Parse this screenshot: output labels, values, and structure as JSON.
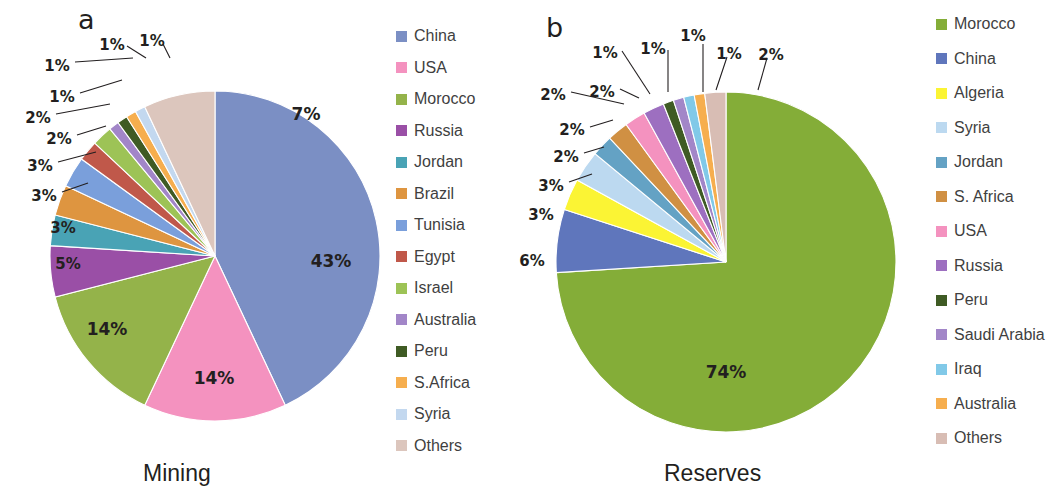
{
  "figure": {
    "panels": [
      {
        "letter": "a",
        "caption": "Mining",
        "legend_title": ""
      },
      {
        "letter": "b",
        "caption": "Reserves",
        "legend_title": ""
      }
    ]
  },
  "chart_data": [
    {
      "type": "pie",
      "title": "Mining",
      "panel_letter": "a",
      "labels": [
        "China",
        "USA",
        "Morocco",
        "Russia",
        "Jordan",
        "Brazil",
        "Tunisia",
        "Egypt",
        "Israel",
        "Australia",
        "Peru",
        "S.Africa",
        "Syria",
        "Others"
      ],
      "values": [
        43,
        14,
        14,
        5,
        3,
        3,
        3,
        2,
        2,
        1,
        1,
        1,
        1,
        7
      ],
      "value_labels": [
        "43%",
        "14%",
        "14%",
        "5%",
        "3%",
        "3%",
        "3%",
        "2%",
        "2%",
        "1%",
        "1%",
        "1%",
        "1%",
        "7%"
      ],
      "colors": [
        "#7b8fc4",
        "#f492bf",
        "#94b34a",
        "#9a4fa6",
        "#49a3b5",
        "#de9540",
        "#7a9fdb",
        "#c0584a",
        "#9dc356",
        "#a286c8",
        "#3f5b24",
        "#f6ae4e",
        "#c3d8ef",
        "#dcc6bd"
      ],
      "legend_position": "right",
      "units": "percent"
    },
    {
      "type": "pie",
      "title": "Reserves",
      "panel_letter": "b",
      "labels": [
        "Morocco",
        "China",
        "Algeria",
        "Syria",
        "Jordan",
        "S. Africa",
        "USA",
        "Russia",
        "Peru",
        "Saudi Arabia",
        "Iraq",
        "Australia",
        "Others"
      ],
      "values": [
        74,
        6,
        3,
        3,
        2,
        2,
        2,
        2,
        1,
        1,
        1,
        1,
        2
      ],
      "value_labels": [
        "74%",
        "6%",
        "3%",
        "3%",
        "2%",
        "2%",
        "2%",
        "2%",
        "1%",
        "1%",
        "1%",
        "1%",
        "2%"
      ],
      "colors": [
        "#84ad38",
        "#5f76bc",
        "#fbf434",
        "#bcd9f0",
        "#64a2c4",
        "#d09043",
        "#f492bf",
        "#9d6fc0",
        "#3f5b24",
        "#a286c8",
        "#81c9e8",
        "#f6ae4e",
        "#d8bdb4"
      ],
      "legend_position": "right",
      "units": "percent"
    }
  ],
  "legend_a": {
    "items": [
      {
        "label": "China",
        "color": "#7b8fc4"
      },
      {
        "label": "USA",
        "color": "#f492bf"
      },
      {
        "label": "Morocco",
        "color": "#94b34a"
      },
      {
        "label": "Russia",
        "color": "#9a4fa6"
      },
      {
        "label": "Jordan",
        "color": "#49a3b5"
      },
      {
        "label": "Brazil",
        "color": "#de9540"
      },
      {
        "label": "Tunisia",
        "color": "#7a9fdb"
      },
      {
        "label": "Egypt",
        "color": "#c0584a"
      },
      {
        "label": "Israel",
        "color": "#9dc356"
      },
      {
        "label": "Australia",
        "color": "#a286c8"
      },
      {
        "label": "Peru",
        "color": "#3f5b24"
      },
      {
        "label": "S.Africa",
        "color": "#f6ae4e"
      },
      {
        "label": "Syria",
        "color": "#c3d8ef"
      },
      {
        "label": "Others",
        "color": "#dcc6bd"
      }
    ]
  },
  "legend_b": {
    "items": [
      {
        "label": "Morocco",
        "color": "#84ad38"
      },
      {
        "label": "China",
        "color": "#5f76bc"
      },
      {
        "label": "Algeria",
        "color": "#fbf434"
      },
      {
        "label": "Syria",
        "color": "#bcd9f0"
      },
      {
        "label": "Jordan",
        "color": "#64a2c4"
      },
      {
        "label": "S. Africa",
        "color": "#d09043"
      },
      {
        "label": "USA",
        "color": "#f492bf"
      },
      {
        "label": "Russia",
        "color": "#9d6fc0"
      },
      {
        "label": "Peru",
        "color": "#3f5b24"
      },
      {
        "label": "Saudi Arabia",
        "color": "#a286c8"
      },
      {
        "label": "Iraq",
        "color": "#81c9e8"
      },
      {
        "label": "Australia",
        "color": "#f6ae4e"
      },
      {
        "label": "Others",
        "color": "#d8bdb4"
      }
    ]
  },
  "geometry": {
    "pie_a": {
      "cx": 215,
      "cy": 256,
      "r": 165,
      "start_angle_deg": -90
    },
    "pie_b": {
      "cx": 726,
      "cy": 262,
      "r": 170,
      "start_angle_deg": -90
    },
    "label_a": [
      {
        "text": "43%",
        "x": 331,
        "y": 262,
        "big": true
      },
      {
        "text": "14%",
        "x": 214,
        "y": 379,
        "big": true
      },
      {
        "text": "14%",
        "x": 107,
        "y": 330,
        "big": true
      },
      {
        "text": "5%",
        "x": 68,
        "y": 264
      },
      {
        "text": "3%",
        "x": 63,
        "y": 228
      },
      {
        "text": "3%",
        "x": 44,
        "y": 196,
        "leader": [
          [
            62,
            192
          ],
          [
            88,
            183
          ]
        ]
      },
      {
        "text": "3%",
        "x": 40,
        "y": 166,
        "leader": [
          [
            58,
            162
          ],
          [
            96,
            152
          ]
        ]
      },
      {
        "text": "2%",
        "x": 59,
        "y": 139,
        "leader": [
          [
            77,
            135
          ],
          [
            106,
            126
          ]
        ]
      },
      {
        "text": "2%",
        "x": 38,
        "y": 118,
        "leader": [
          [
            56,
            114
          ],
          [
            110,
            104
          ]
        ]
      },
      {
        "text": "1%",
        "x": 62,
        "y": 97,
        "leader": [
          [
            80,
            93
          ],
          [
            122,
            80
          ]
        ]
      },
      {
        "text": "1%",
        "x": 57,
        "y": 66,
        "leader": [
          [
            75,
            62
          ],
          [
            133,
            58
          ]
        ]
      },
      {
        "text": "1%",
        "x": 112,
        "y": 45,
        "leader": [
          [
            127,
            46
          ],
          [
            146,
            58
          ]
        ]
      },
      {
        "text": "1%",
        "x": 152,
        "y": 41,
        "leader": [
          [
            163,
            44
          ],
          [
            170,
            58
          ]
        ]
      },
      {
        "text": "7%",
        "x": 306,
        "y": 115,
        "big": true
      }
    ],
    "label_b": [
      {
        "text": "74%",
        "x": 726,
        "y": 373,
        "big": true
      },
      {
        "text": "6%",
        "x": 532,
        "y": 261
      },
      {
        "text": "3%",
        "x": 541,
        "y": 215
      },
      {
        "text": "3%",
        "x": 551,
        "y": 186,
        "leader": [
          [
            569,
            182
          ],
          [
            592,
            174
          ]
        ]
      },
      {
        "text": "2%",
        "x": 566,
        "y": 157,
        "leader": [
          [
            584,
            153
          ],
          [
            604,
            147
          ]
        ]
      },
      {
        "text": "2%",
        "x": 572,
        "y": 130,
        "leader": [
          [
            590,
            127
          ],
          [
            613,
            120
          ]
        ]
      },
      {
        "text": "2%",
        "x": 553,
        "y": 95,
        "leader": [
          [
            571,
            92
          ],
          [
            624,
            104
          ]
        ]
      },
      {
        "text": "2%",
        "x": 602,
        "y": 92,
        "leader": [
          [
            620,
            89
          ],
          [
            639,
            98
          ]
        ]
      },
      {
        "text": "1%",
        "x": 605,
        "y": 53,
        "leader": [
          [
            622,
            51
          ],
          [
            650,
            94
          ]
        ]
      },
      {
        "text": "1%",
        "x": 653,
        "y": 49,
        "leader": [
          [
            668,
            50
          ],
          [
            668,
            92
          ]
        ]
      },
      {
        "text": "1%",
        "x": 693,
        "y": 36,
        "leader": [
          [
            703,
            44
          ],
          [
            703,
            92
          ]
        ]
      },
      {
        "text": "1%",
        "x": 729,
        "y": 54,
        "leader": [
          [
            727,
            57
          ],
          [
            716,
            90
          ]
        ]
      },
      {
        "text": "2%",
        "x": 771,
        "y": 55,
        "leader": [
          [
            767,
            58
          ],
          [
            758,
            90
          ]
        ]
      }
    ],
    "legend_a_box": {
      "x": 396,
      "y": 28,
      "row_h": 31.5
    },
    "legend_b_box": {
      "x": 936,
      "y": 16,
      "row_h": 34.5
    },
    "letter_a": {
      "x": 78,
      "y": 4
    },
    "letter_b": {
      "x": 546,
      "y": 12
    },
    "caption_a": {
      "x": 143,
      "y": 460
    },
    "caption_b": {
      "x": 664,
      "y": 460
    }
  }
}
